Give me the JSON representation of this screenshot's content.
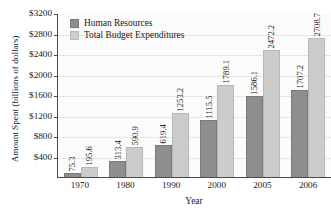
{
  "chart_data": {
    "type": "bar",
    "title": "",
    "xlabel": "Year",
    "ylabel": "Amount Spent (billions of dollars)",
    "categories": [
      "1970",
      "1980",
      "1990",
      "2000",
      "2005",
      "2006"
    ],
    "series": [
      {
        "name": "Human Resources",
        "color": "#8e8e8e",
        "values": [
          75.3,
          313.4,
          619.4,
          1115.5,
          1586.1,
          1707.2
        ],
        "labels": [
          "75.3",
          "313.4",
          "619.4",
          "1115.5",
          "1586.1",
          "1707.2"
        ]
      },
      {
        "name": "Total Budget Expenditures",
        "color": "#cccccc",
        "values": [
          195.6,
          590.9,
          1253.2,
          1789.1,
          2472.2,
          2708.7
        ],
        "labels": [
          "195.6",
          "590.9",
          "1253.2",
          "1789.1",
          "2472.2",
          "2708.7"
        ]
      }
    ],
    "ylim": [
      0,
      3200
    ],
    "ytick_values": [
      3200,
      2800,
      2400,
      2000,
      1600,
      1200,
      800,
      400
    ],
    "ytick_labels": [
      "$3200",
      "$2800",
      "$2400",
      "$2000",
      "$1600",
      "$1200",
      "$800",
      "$400"
    ],
    "grid": true,
    "legend_position": "top-left"
  },
  "legend": {
    "items": [
      {
        "label": "Human Resources"
      },
      {
        "label": "Total Budget Expenditures"
      }
    ]
  }
}
